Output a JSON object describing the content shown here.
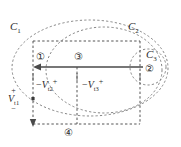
{
  "figure": {
    "type": "circuit-mesh-diagram",
    "background_color": "#ffffff",
    "line_color": "#6b6b6b",
    "text_color": "#2b2b2b",
    "width": 181,
    "height": 147
  },
  "loop_labels": {
    "c1": {
      "letter": "C",
      "sub": "1"
    },
    "c2": {
      "letter": "C",
      "sub": "2"
    },
    "c3": {
      "letter": "C",
      "sub": "3"
    }
  },
  "nodes": [
    {
      "id": "node-1",
      "label": "①"
    },
    {
      "id": "node-2",
      "label": "②"
    },
    {
      "id": "node-3",
      "label": "③"
    },
    {
      "id": "node-4",
      "label": "④"
    }
  ],
  "voltages": [
    {
      "id": "v-t2",
      "minus": "−",
      "symbol": "V",
      "sub": "t2",
      "plus": "+"
    },
    {
      "id": "v-t3",
      "minus": "−",
      "symbol": "V",
      "sub": "t3",
      "plus": "+"
    }
  ],
  "source": {
    "id": "v-t1",
    "top_sign": "+",
    "symbol": "V",
    "sub": "t1",
    "bottom_sign": "−"
  }
}
